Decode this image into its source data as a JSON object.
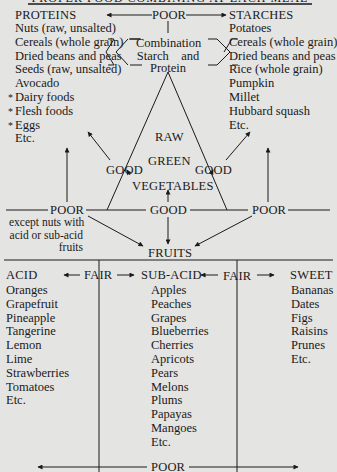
{
  "title_partial": "PROPER FOOD COMBINING AT EACH MEAL",
  "top": {
    "proteins": {
      "heading": "PROTEINS",
      "items": [
        "Nuts (raw, unsalted)",
        "Cereals (whole grain)",
        "Dried beans and peas",
        "Seeds (raw, unsalted)",
        "Avocado",
        "Dairy foods",
        "Flesh foods",
        "Eggs",
        "Etc."
      ],
      "starred": [
        5,
        6,
        7
      ]
    },
    "starches": {
      "heading": "STARCHES",
      "items": [
        "Potatoes",
        "Cereals (whole grain)",
        "Dried beans and peas",
        "Rice (whole grain)",
        "Pumpkin",
        "Millet",
        "Hubbard squash",
        "Etc."
      ]
    },
    "poor_top": "POOR",
    "combination": [
      "Combination",
      "Starch    and",
      "Protein"
    ],
    "triangle": [
      "RAW",
      "GREEN",
      "VEGETABLES"
    ],
    "good_left": "GOOD",
    "good_right": "GOOD",
    "good_center": "GOOD",
    "poor_left": "POOR",
    "poor_left_note": [
      "except nuts with",
      "acid or sub-acid",
      "fruits"
    ],
    "poor_right": "POOR",
    "fruits": "FRUITS"
  },
  "bottom": {
    "acid": {
      "heading": "ACID",
      "items": [
        "Oranges",
        "Grapefruit",
        "Pineapple",
        "Tangerine",
        "Lemon",
        "Lime",
        "Strawberries",
        "Tomatoes",
        "Etc."
      ]
    },
    "sub_acid": {
      "heading": "SUB-ACID",
      "items": [
        "Apples",
        "Peaches",
        "Grapes",
        "Blueberries",
        "Cherries",
        "Apricots",
        "Pears",
        "Melons",
        "Plums",
        "Papayas",
        "Mangoes",
        "Etc."
      ]
    },
    "sweet": {
      "heading": "SWEET",
      "items": [
        "Bananas",
        "Dates",
        "Figs",
        "Raisins",
        "Prunes",
        "Etc."
      ]
    },
    "fair_left": "FAIR",
    "fair_right": "FAIR",
    "poor_bottom": "POOR"
  },
  "colors": {
    "background": "#e4e4e2",
    "ink": "#1a1a1a"
  }
}
